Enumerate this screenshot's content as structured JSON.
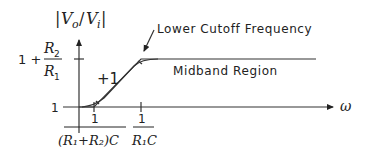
{
  "diagram": {
    "type": "bode-magnitude-sketch",
    "y_axis": {
      "label_prefix": "|",
      "label_vo": "V",
      "label_vo_sub": "o",
      "label_slash": "/",
      "label_vi": "V",
      "label_vi_sub": "i",
      "label_suffix": "|",
      "tick_high_prefix": "1 +",
      "tick_high_num": "R",
      "tick_high_num_sub": "2",
      "tick_high_den": "R",
      "tick_high_den_sub": "1",
      "tick_low": "1"
    },
    "x_axis": {
      "label": "ω",
      "tick1_num": "1",
      "tick1_den": "(R₁+R₂)C",
      "tick2_num": "1",
      "tick2_den": "R₁C"
    },
    "annotations": {
      "slope": "+1",
      "cutoff": "Lower Cutoff Frequency",
      "midband": "Midband Region"
    }
  }
}
